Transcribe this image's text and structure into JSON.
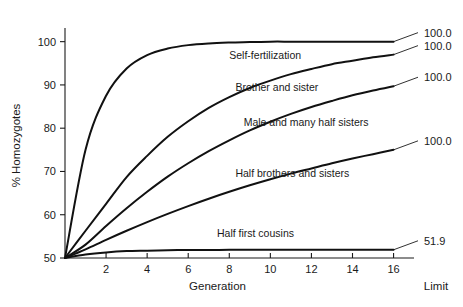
{
  "chart_data": {
    "type": "line",
    "title": "",
    "xlabel": "Generation",
    "ylabel": "% Homozygotes",
    "xlim": [
      0,
      16.8
    ],
    "ylim": [
      50,
      102
    ],
    "grid": false,
    "legend_position": "inline-curve-labels",
    "x_ticks": [
      2,
      4,
      6,
      8,
      10,
      12,
      14,
      16
    ],
    "y_ticks": [
      50,
      60,
      70,
      80,
      90,
      100
    ],
    "x": [
      0,
      1,
      2,
      3,
      4,
      5,
      6,
      7,
      8,
      9,
      10,
      11,
      12,
      13,
      14,
      15,
      16
    ],
    "limit_column_header": "Limit",
    "series": [
      {
        "name": "Self-fertilization",
        "label_x": 8.0,
        "label_y": 97.0,
        "limit": "100.0",
        "values": [
          50.0,
          75.0,
          87.5,
          93.8,
          96.9,
          98.4,
          99.2,
          99.6,
          99.8,
          99.9,
          100.0,
          100.0,
          100.0,
          100.0,
          100.0,
          100.0,
          100.0
        ]
      },
      {
        "name": "Brother and sister",
        "label_x": 8.3,
        "label_y": 89.6,
        "limit": "100.0",
        "values": [
          50.0,
          56.3,
          62.5,
          68.7,
          73.6,
          78.0,
          81.6,
          84.7,
          87.2,
          89.3,
          91.0,
          92.5,
          93.7,
          94.8,
          95.6,
          96.4,
          97.0
        ]
      },
      {
        "name": "Male and many half sisters",
        "label_x": 8.7,
        "label_y": 81.4,
        "limit": "100.0",
        "values": [
          50.0,
          53.1,
          57.4,
          61.5,
          65.3,
          68.8,
          71.9,
          74.7,
          77.2,
          79.5,
          81.5,
          83.3,
          84.9,
          86.3,
          87.6,
          88.7,
          89.7
        ]
      },
      {
        "name": "Half brothers and sisters",
        "label_x": 8.3,
        "label_y": 69.7,
        "limit": "100.0",
        "values": [
          50.0,
          52.0,
          54.2,
          56.3,
          58.3,
          60.2,
          62.0,
          63.7,
          65.3,
          66.8,
          68.2,
          69.5,
          70.7,
          71.9,
          73.0,
          74.0,
          75.0
        ]
      },
      {
        "name": "Half first cousins",
        "label_x": 7.4,
        "label_y": 55.8,
        "limit": "51.9",
        "values": [
          50.0,
          50.8,
          51.3,
          51.6,
          51.7,
          51.8,
          51.85,
          51.87,
          51.88,
          51.89,
          51.9,
          51.9,
          51.9,
          51.9,
          51.9,
          51.9,
          51.9
        ]
      }
    ]
  }
}
